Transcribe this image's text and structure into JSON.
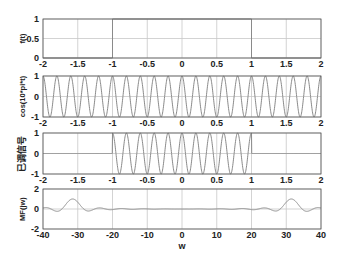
{
  "chart_data": [
    {
      "type": "line",
      "title": "",
      "xlabel": "",
      "ylabel": "f(t)",
      "xlim": [
        -2,
        2
      ],
      "ylim": [
        0,
        1
      ],
      "xticks": [
        "-2",
        "-1.5",
        "-1",
        "-0.5",
        "0",
        "0.5",
        "1",
        "1.5",
        "2"
      ],
      "yticks": [
        "0",
        "0.5",
        "1"
      ],
      "grid": true,
      "description": "Rectangular pulse: f(t)=1 for -1<t<1, 0 otherwise",
      "series": [
        {
          "name": "f(t)",
          "x": [
            -2,
            -1,
            -1,
            1,
            1,
            2
          ],
          "y": [
            0,
            0,
            1,
            1,
            0,
            0
          ]
        }
      ]
    },
    {
      "type": "line",
      "title": "",
      "xlabel": "",
      "ylabel": "cos(10*pi*t)",
      "xlim": [
        -2,
        2
      ],
      "ylim": [
        -1,
        1
      ],
      "xticks": [
        "-2",
        "-1.5",
        "-1",
        "-0.5",
        "0",
        "0.5",
        "1",
        "1.5",
        "2"
      ],
      "yticks": [
        "-1",
        "0",
        "1"
      ],
      "grid": true,
      "description": "Carrier cos(10*pi*t), 20 periods over [-2,2]",
      "series": [
        {
          "name": "cos(10*pi*t)",
          "function": "cos(10*pi*t)",
          "frequency_hz": 5
        }
      ]
    },
    {
      "type": "line",
      "title": "",
      "xlabel": "",
      "ylabel": "已调信号",
      "xlim": [
        -2,
        2
      ],
      "ylim": [
        -1,
        1
      ],
      "xticks": [
        "-2",
        "-1.5",
        "-1",
        "-0.5",
        "0",
        "0.5",
        "1",
        "1.5",
        "2"
      ],
      "yticks": [
        "-1",
        "0",
        "1"
      ],
      "grid": true,
      "description": "Modulated signal f(t)*cos(10*pi*t), nonzero only on [-1,1]",
      "series": [
        {
          "name": "modulated",
          "function": "f(t)*cos(10*pi*t)"
        }
      ]
    },
    {
      "type": "line",
      "title": "",
      "xlabel": "w",
      "ylabel": "MF(jw)",
      "xlim": [
        -40,
        40
      ],
      "ylim": [
        -2,
        2
      ],
      "xticks": [
        "-40",
        "-30",
        "-20",
        "-10",
        "0",
        "10",
        "20",
        "30",
        "40"
      ],
      "yticks": [
        "-2",
        "0",
        "2"
      ],
      "grid": true,
      "description": "Spectrum: sinc-shaped peaks of height ~1 at w=±10*pi (~±31.4)",
      "series": [
        {
          "name": "MF(jw)",
          "function": "sin(w-10pi)/(w-10pi) + sin(w+10pi)/(w+10pi)",
          "peaks": [
            {
              "x": -31.4,
              "y": 1.0
            },
            {
              "x": 31.4,
              "y": 1.0
            }
          ]
        }
      ]
    }
  ],
  "axes": [
    {
      "ylabel": "f(t)",
      "xticks": [
        "-2",
        "-1.5",
        "-1",
        "-0.5",
        "0",
        "0.5",
        "1",
        "1.5",
        "2"
      ],
      "yticks": [
        "0",
        "0.5",
        "1"
      ]
    },
    {
      "ylabel": "cos(10*pi*t)",
      "xticks": [
        "-2",
        "-1.5",
        "-1",
        "-0.5",
        "0",
        "0.5",
        "1",
        "1.5",
        "2"
      ],
      "yticks": [
        "-1",
        "0",
        "1"
      ]
    },
    {
      "ylabel": "已调信号",
      "xticks": [
        "-2",
        "-1.5",
        "-1",
        "-0.5",
        "0",
        "0.5",
        "1",
        "1.5",
        "2"
      ],
      "yticks": [
        "-1",
        "0",
        "1"
      ]
    },
    {
      "ylabel": "MF(jw)",
      "xlabel": "w",
      "xticks": [
        "-40",
        "-30",
        "-20",
        "-10",
        "0",
        "10",
        "20",
        "30",
        "40"
      ],
      "yticks": [
        "-2",
        "0",
        "2"
      ]
    }
  ],
  "colors": {
    "line": "#8a8a8a",
    "grid": "#c8c8c8",
    "axes": "#555555",
    "text": "#222222"
  }
}
